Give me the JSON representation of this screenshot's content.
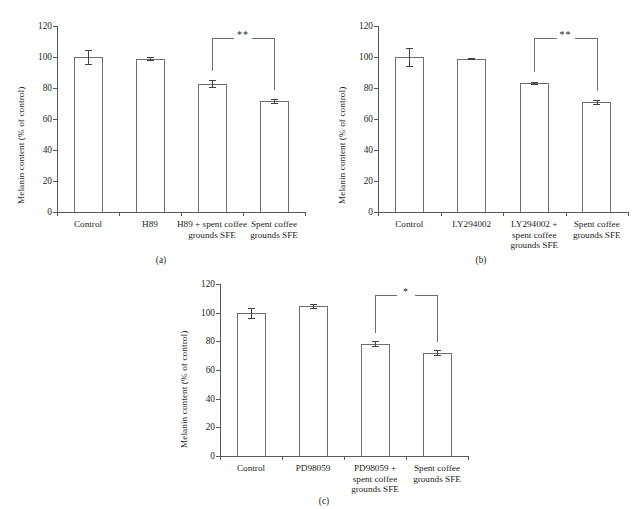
{
  "figure": {
    "panels": [
      {
        "id": "a",
        "caption": "(a)",
        "ylabel": "Melanin content (% of control)",
        "categories": [
          "Control",
          "H89",
          "H89 + spent coffee\ngrounds SFE",
          "Spent coffee\ngrounds SFE"
        ],
        "values": [
          100,
          99,
          82.7,
          71.8
        ],
        "errors": [
          4.2,
          0.7,
          2.2,
          1.2
        ],
        "yticks": [
          0,
          20,
          40,
          60,
          80,
          100,
          120
        ],
        "significance": {
          "label": "**",
          "from": 2,
          "to": 3
        }
      },
      {
        "id": "b",
        "caption": "(b)",
        "ylabel": "Melanin content (% of control)",
        "categories": [
          "Control",
          "LY294002",
          "LY294002 +\nspent coffee\ngrounds SFE",
          "Spent coffee\ngrounds SFE"
        ],
        "values": [
          100,
          99,
          83.2,
          70.8
        ],
        "errors": [
          5.8,
          0.6,
          0.8,
          1.3
        ],
        "yticks": [
          0,
          20,
          40,
          60,
          80,
          100,
          120
        ],
        "significance": {
          "label": "**",
          "from": 2,
          "to": 3
        }
      },
      {
        "id": "c",
        "caption": "(c)",
        "ylabel": "Melanin content (% of control)",
        "categories": [
          "Control",
          "PD98059",
          "PD98059 +\nspent coffee\ngrounds SFE",
          "Spent coffee\ngrounds SFE"
        ],
        "values": [
          99.8,
          104.6,
          78.2,
          72.2
        ],
        "errors": [
          3.2,
          1.5,
          1.8,
          1.6
        ],
        "yticks": [
          0,
          20,
          40,
          60,
          80,
          100,
          120
        ],
        "significance": {
          "label": "*",
          "from": 2,
          "to": 3
        }
      }
    ]
  },
  "chart_data": [
    {
      "type": "bar",
      "panel": "(a)",
      "title": "",
      "xlabel": "",
      "ylabel": "Melanin content (% of control)",
      "categories": [
        "Control",
        "H89",
        "H89 + spent coffee grounds SFE",
        "Spent coffee grounds SFE"
      ],
      "values": [
        100,
        99,
        82.7,
        71.8
      ],
      "errors": [
        4.2,
        0.7,
        2.2,
        1.2
      ],
      "ylim": [
        0,
        120
      ],
      "ytick_step": 20,
      "grid": false,
      "legend": "none",
      "annotations": [
        {
          "text": "**",
          "between": [
            "H89 + spent coffee grounds SFE",
            "Spent coffee grounds SFE"
          ]
        }
      ]
    },
    {
      "type": "bar",
      "panel": "(b)",
      "title": "",
      "xlabel": "",
      "ylabel": "Melanin content (% of control)",
      "categories": [
        "Control",
        "LY294002",
        "LY294002 + spent coffee grounds SFE",
        "Spent coffee grounds SFE"
      ],
      "values": [
        100,
        99,
        83.2,
        70.8
      ],
      "errors": [
        5.8,
        0.6,
        0.8,
        1.3
      ],
      "ylim": [
        0,
        120
      ],
      "ytick_step": 20,
      "grid": false,
      "legend": "none",
      "annotations": [
        {
          "text": "**",
          "between": [
            "LY294002 + spent coffee grounds SFE",
            "Spent coffee grounds SFE"
          ]
        }
      ]
    },
    {
      "type": "bar",
      "panel": "(c)",
      "title": "",
      "xlabel": "",
      "ylabel": "Melanin content (% of control)",
      "categories": [
        "Control",
        "PD98059",
        "PD98059 + spent coffee grounds SFE",
        "Spent coffee grounds SFE"
      ],
      "values": [
        99.8,
        104.6,
        78.2,
        72.2
      ],
      "errors": [
        3.2,
        1.5,
        1.8,
        1.6
      ],
      "ylim": [
        0,
        120
      ],
      "ytick_step": 20,
      "grid": false,
      "legend": "none",
      "annotations": [
        {
          "text": "*",
          "between": [
            "PD98059 + spent coffee grounds SFE",
            "Spent coffee grounds SFE"
          ]
        }
      ]
    }
  ]
}
